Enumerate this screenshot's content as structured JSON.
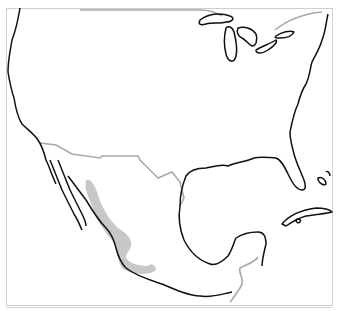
{
  "map": {
    "region": "North America (United States, Mexico, Caribbean)",
    "colors": {
      "coastline": "#111111",
      "border": "#a8a8a8",
      "highlight": "#c8c8c8",
      "background": "#ffffff",
      "frame": "#cfcfcf"
    },
    "layers": [
      {
        "name": "coastline",
        "style": "black line"
      },
      {
        "name": "international-border",
        "style": "gray line"
      },
      {
        "name": "highlighted-range",
        "style": "light gray fill",
        "location": "western Mexico (Sierra Madre Occidental to southern Mexico)"
      }
    ]
  }
}
